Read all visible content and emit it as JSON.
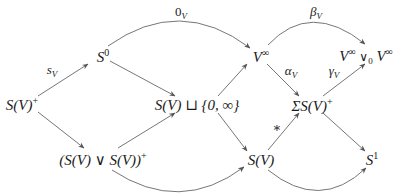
{
  "diagram": {
    "type": "commutative-diagram",
    "nodes": {
      "sv_plus": {
        "base": "S(V)",
        "sup": "+"
      },
      "s0": {
        "base": "S",
        "sup": "0"
      },
      "sv_disjoint": {
        "text": "S(V) ⊔ {0, ∞}"
      },
      "wedge_plus": {
        "base": "(S(V) ∨ S(V))",
        "sup": "+"
      },
      "v_inf": {
        "base": "V",
        "sup": "∞"
      },
      "sigma_sv_plus": {
        "base": "ΣS(V)",
        "sup": "+"
      },
      "sv": {
        "text": "S(V)"
      },
      "v_inf_wedge": {
        "left_base": "V",
        "left_sup": "∞",
        "op": "∨",
        "op_sub": "0",
        "right_base": "V",
        "right_sup": "∞"
      },
      "s1": {
        "base": "S",
        "sup": "1"
      }
    },
    "edge_labels": {
      "s_v": {
        "base": "s",
        "sub": "V"
      },
      "zero_v": {
        "base": "0",
        "sub": "V"
      },
      "beta_v": {
        "base": "β",
        "sub": "V"
      },
      "alpha_v": {
        "base": "α",
        "sub": "V"
      },
      "gamma_v": {
        "base": "γ",
        "sub": "V"
      },
      "star": "∗"
    },
    "edges": [
      {
        "from": "S(V)+",
        "to": "S0",
        "label": "s_V"
      },
      {
        "from": "S(V)+",
        "to": "(S(V) ∨ S(V))+",
        "label": ""
      },
      {
        "from": "S0",
        "to": "V∞",
        "label": "0_V",
        "curved": true
      },
      {
        "from": "S0",
        "to": "S(V) ⊔ {0,∞}",
        "label": ""
      },
      {
        "from": "(S(V) ∨ S(V))+",
        "to": "S(V) ⊔ {0,∞}",
        "label": ""
      },
      {
        "from": "(S(V) ∨ S(V))+",
        "to": "S(V)",
        "label": "",
        "curved": true
      },
      {
        "from": "S(V) ⊔ {0,∞}",
        "to": "V∞",
        "label": ""
      },
      {
        "from": "S(V) ⊔ {0,∞}",
        "to": "S(V)",
        "label": ""
      },
      {
        "from": "V∞",
        "to": "V∞ ∨0 V∞",
        "label": "β_V",
        "curved": true
      },
      {
        "from": "V∞",
        "to": "ΣS(V)+",
        "label": "α_V"
      },
      {
        "from": "S(V)",
        "to": "ΣS(V)+",
        "label": "∗"
      },
      {
        "from": "ΣS(V)+",
        "to": "V∞ ∨0 V∞",
        "label": "γ_V"
      },
      {
        "from": "ΣS(V)+",
        "to": "S1",
        "label": ""
      },
      {
        "from": "S(V)",
        "to": "S1",
        "label": "",
        "curved": true
      }
    ],
    "colors": {
      "line": "#555555",
      "text": "#1a1a1a"
    }
  }
}
